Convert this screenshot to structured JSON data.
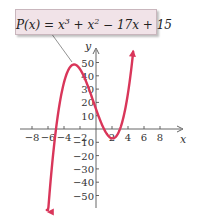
{
  "chart_data": {
    "type": "line",
    "function": "x^3 + x^2 - 17x + 15",
    "label_parts": {
      "lhs": "P(x) = x",
      "exp1": "3",
      "mid": " + x",
      "exp2": "2",
      "rhs": " − 17x + 15"
    },
    "xlabel": "x",
    "ylabel": "y",
    "x_ticks": [
      -8,
      -6,
      -4,
      -2,
      2,
      4,
      6,
      8
    ],
    "x_tick_labels": [
      "−8",
      "−6",
      "−4",
      "−2",
      "2",
      "4",
      "6",
      "8"
    ],
    "y_ticks": [
      50,
      40,
      30,
      20,
      10,
      -10,
      -20,
      -30,
      -40,
      -50
    ],
    "y_tick_labels": [
      "50",
      "40",
      "30",
      "20",
      "10",
      "−10",
      "−20",
      "−30",
      "−40",
      "−50"
    ],
    "xlim": [
      -9.5,
      10.9
    ],
    "ylim": [
      -58,
      60
    ],
    "grid": false,
    "curve_color": "#d9365a",
    "x_range_plotted": [
      -6.15,
      4.65
    ],
    "key_points": {
      "roots": [
        -5,
        1,
        3
      ],
      "y_intercept": 15,
      "local_max": {
        "x": -2.7,
        "y": 48.1
      },
      "local_min": {
        "x": 2.05,
        "y": -5.05
      }
    },
    "annotations": [
      "leader line from label box to local maximum"
    ]
  }
}
